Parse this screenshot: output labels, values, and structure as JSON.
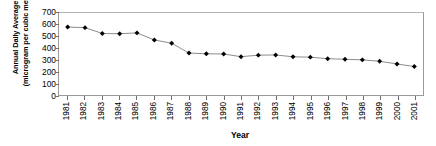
{
  "chart_data": {
    "type": "line",
    "title": "",
    "xlabel": "Year",
    "ylabel": "Annual Daily Average (microgram per cubic meter)",
    "ylabel_line1": "Annual Daily Average",
    "ylabel_line2": "(microgram per cubic meter)",
    "categories": [
      "1981",
      "1982",
      "1983",
      "1984",
      "1985",
      "1986",
      "1987",
      "1988",
      "1989",
      "1990",
      "1991",
      "1992",
      "1993",
      "1994",
      "1995",
      "1996",
      "1997",
      "1998",
      "1999",
      "2000",
      "2001"
    ],
    "values": [
      580,
      575,
      525,
      523,
      530,
      470,
      442,
      358,
      352,
      350,
      327,
      340,
      342,
      326,
      323,
      310,
      305,
      300,
      288,
      265,
      243
    ],
    "ylim": [
      0,
      700
    ],
    "yticks": [
      700,
      600,
      500,
      400,
      300,
      200,
      100,
      0
    ],
    "ytick_labels": [
      "700",
      "600",
      "500",
      "400",
      "300",
      "200",
      "100",
      "0"
    ],
    "grid": false,
    "legend": false,
    "marker": "diamond",
    "marker_color": "#000000",
    "line_color": "#808080"
  }
}
